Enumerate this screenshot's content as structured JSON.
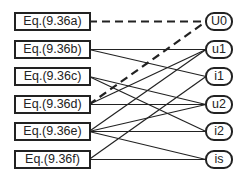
{
  "equations": [
    {
      "id": "a",
      "label": "Eq.(9.36a)",
      "top": 12
    },
    {
      "id": "b",
      "label": "Eq.(9.36b)",
      "top": 40
    },
    {
      "id": "c",
      "label": "Eq.(9.36c)",
      "top": 67
    },
    {
      "id": "d",
      "label": "Eq.(9.36d)",
      "top": 95
    },
    {
      "id": "e",
      "label": "Eq.(9.36e)",
      "top": 122
    },
    {
      "id": "f",
      "label": "Eq.(9.36f)",
      "top": 150
    }
  ],
  "variables": [
    {
      "id": "U0",
      "label": "U0",
      "top": 12
    },
    {
      "id": "u1",
      "label": "u1",
      "top": 40
    },
    {
      "id": "i1",
      "label": "i1",
      "top": 67
    },
    {
      "id": "u2",
      "label": "u2",
      "top": 95
    },
    {
      "id": "i2",
      "label": "i2",
      "top": 122
    },
    {
      "id": "is",
      "label": "is",
      "top": 150
    }
  ],
  "edges": [
    {
      "from": "a",
      "to": "U0",
      "style": "dashed"
    },
    {
      "from": "d",
      "to": "U0",
      "style": "dashed"
    },
    {
      "from": "b",
      "to": "u1",
      "style": "solid"
    },
    {
      "from": "b",
      "to": "i1",
      "style": "solid"
    },
    {
      "from": "c",
      "to": "u2",
      "style": "solid"
    },
    {
      "from": "c",
      "to": "i2",
      "style": "solid"
    },
    {
      "from": "d",
      "to": "u2",
      "style": "solid"
    },
    {
      "from": "d",
      "to": "u1",
      "style": "solid"
    },
    {
      "from": "e",
      "to": "i2",
      "style": "solid"
    },
    {
      "from": "e",
      "to": "u1",
      "style": "solid"
    },
    {
      "from": "e",
      "to": "u2",
      "style": "solid"
    },
    {
      "from": "e",
      "to": "is",
      "style": "solid"
    },
    {
      "from": "f",
      "to": "is",
      "style": "solid"
    },
    {
      "from": "f",
      "to": "i1",
      "style": "solid"
    }
  ],
  "colors": {
    "stroke": "#222222",
    "background": "#ffffff"
  }
}
